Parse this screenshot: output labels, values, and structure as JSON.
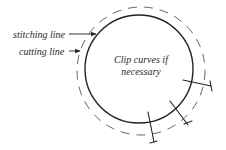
{
  "labels": {
    "stitching_line": "stitching line",
    "cutting_line": "cutting line",
    "clip_note": "Clip curves if necessary"
  },
  "colors": {
    "stroke": "#222222",
    "dashed": "#555555",
    "background": "#ffffff"
  },
  "shapes": {
    "stitching_circle": {
      "style": "solid",
      "cx": 139,
      "cy": 69,
      "r": 54
    },
    "cutting_circle": {
      "style": "dashed",
      "cx": 141,
      "cy": 71,
      "r": 64
    },
    "clip_marks": 3
  }
}
